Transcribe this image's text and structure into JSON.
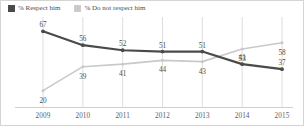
{
  "legend": {
    "items": [
      {
        "label": "% Respect him",
        "color": "#4a4a4a",
        "icon": "legend-swatch-dark"
      },
      {
        "label": "% Do not respect him",
        "color": "#c9c9c9",
        "icon": "legend-swatch-light"
      }
    ]
  },
  "chart_data": {
    "type": "line",
    "title": "",
    "subtitle": "",
    "xlabel": "",
    "ylabel": "",
    "categories": [
      "2009",
      "2010",
      "2011",
      "2012",
      "2013",
      "2014",
      "2015"
    ],
    "x": [
      2009,
      2010,
      2011,
      2012,
      2013,
      2014,
      2015
    ],
    "ylim": [
      15,
      72
    ],
    "grid": "vertical-only",
    "legend_position": "top-left",
    "show_data_labels": true,
    "series": [
      {
        "name": "% Respect him",
        "color": "#4a4a4a",
        "values": [
          67,
          56,
          52,
          51,
          51,
          41,
          37
        ],
        "label_position": "above"
      },
      {
        "name": "% Do not respect him",
        "color": "#c9c9c9",
        "values": [
          20,
          39,
          41,
          44,
          43,
          53,
          58
        ],
        "label_position": "below"
      }
    ]
  },
  "colors": {
    "series_dark": "#4a4a4a",
    "series_light": "#c9c9c9",
    "gridline": "#dedede",
    "axis_rule": "#cfcfcf",
    "text": "#4c4c4e",
    "border": "#d4d4d4",
    "background": "#ffffff"
  }
}
